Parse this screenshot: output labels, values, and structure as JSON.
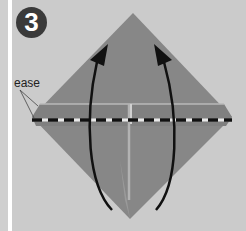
{
  "step": {
    "number": "3"
  },
  "annotation": {
    "label": "ease"
  },
  "colors": {
    "background": "#cbcbcb",
    "paper": "#878787",
    "paper_dark": "#7c7c7c",
    "arrow": "#111111",
    "fold_line_dash": "#111111",
    "fold_line_gap": "#e8e8e8",
    "badge": "#3a3a3a"
  }
}
